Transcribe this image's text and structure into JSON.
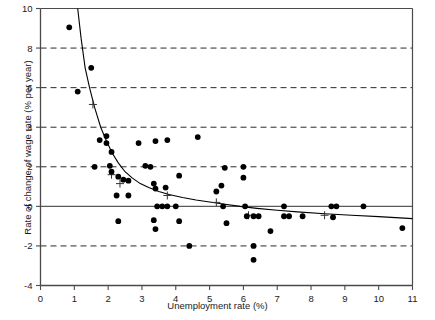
{
  "chart_data": {
    "type": "scatter",
    "title": "",
    "xlabel": "Unemployment rate (%)",
    "ylabel": "Rate of change of wage rate (% per year)",
    "xlim": [
      0,
      11
    ],
    "ylim": [
      -4,
      10
    ],
    "xticks": [
      0,
      1,
      2,
      3,
      4,
      5,
      6,
      7,
      8,
      9,
      10,
      11
    ],
    "yticks": [
      -4,
      -2,
      0,
      2,
      4,
      6,
      8,
      10
    ],
    "grid": "horizontal dashed gridlines at y = -2, 2, 4, 6, 8; solid line at y = 0",
    "legend": "none",
    "series": [
      {
        "name": "Observations",
        "marker": "filled-circle",
        "color": "#000000",
        "points": [
          [
            0.85,
            9.05
          ],
          [
            1.5,
            7.0
          ],
          [
            1.1,
            5.8
          ],
          [
            1.75,
            3.35
          ],
          [
            1.95,
            3.55
          ],
          [
            1.95,
            3.2
          ],
          [
            2.1,
            2.75
          ],
          [
            1.6,
            2.0
          ],
          [
            2.05,
            2.05
          ],
          [
            2.1,
            1.75
          ],
          [
            2.3,
            1.5
          ],
          [
            2.45,
            1.35
          ],
          [
            2.6,
            1.3
          ],
          [
            2.25,
            0.55
          ],
          [
            2.6,
            0.55
          ],
          [
            2.3,
            -0.75
          ],
          [
            2.9,
            3.2
          ],
          [
            3.1,
            2.05
          ],
          [
            3.25,
            2.0
          ],
          [
            3.4,
            3.3
          ],
          [
            3.35,
            1.15
          ],
          [
            3.4,
            0.9
          ],
          [
            3.45,
            0.0
          ],
          [
            3.6,
            0.0
          ],
          [
            3.75,
            0.0
          ],
          [
            3.7,
            0.95
          ],
          [
            3.75,
            3.35
          ],
          [
            3.35,
            -0.7
          ],
          [
            3.4,
            -1.15
          ],
          [
            4.0,
            0.0
          ],
          [
            4.1,
            1.55
          ],
          [
            4.1,
            -0.75
          ],
          [
            4.4,
            -2.0
          ],
          [
            4.65,
            3.5
          ],
          [
            5.2,
            0.75
          ],
          [
            5.35,
            1.05
          ],
          [
            5.4,
            0.0
          ],
          [
            5.5,
            -0.85
          ],
          [
            5.45,
            1.95
          ],
          [
            6.0,
            2.0
          ],
          [
            6.0,
            1.45
          ],
          [
            6.05,
            0.0
          ],
          [
            6.1,
            -0.5
          ],
          [
            6.3,
            -0.5
          ],
          [
            6.45,
            -0.5
          ],
          [
            6.3,
            -2.0
          ],
          [
            6.3,
            -2.7
          ],
          [
            6.8,
            -1.25
          ],
          [
            7.2,
            0.0
          ],
          [
            7.2,
            -0.5
          ],
          [
            7.35,
            -0.5
          ],
          [
            7.75,
            -0.5
          ],
          [
            8.6,
            0.0
          ],
          [
            8.75,
            0.0
          ],
          [
            8.65,
            -0.55
          ],
          [
            9.55,
            0.0
          ],
          [
            10.7,
            -1.1
          ]
        ]
      },
      {
        "name": "Group means",
        "marker": "plus",
        "color": "#333333",
        "points": [
          [
            1.55,
            5.15
          ],
          [
            2.1,
            1.6
          ],
          [
            2.35,
            1.15
          ],
          [
            3.75,
            0.55
          ],
          [
            5.2,
            0.2
          ],
          [
            6.15,
            -0.45
          ],
          [
            8.4,
            -0.45
          ]
        ]
      }
    ],
    "fitted_curve": {
      "name": "Fitted Phillips curve",
      "color": "#000000",
      "points": [
        [
          1.1,
          10.0
        ],
        [
          1.2,
          8.5
        ],
        [
          1.32,
          7.0
        ],
        [
          1.45,
          6.0
        ],
        [
          1.6,
          5.0
        ],
        [
          1.78,
          4.0
        ],
        [
          1.95,
          3.3
        ],
        [
          2.12,
          2.7
        ],
        [
          2.3,
          2.2
        ],
        [
          2.5,
          1.75
        ],
        [
          2.7,
          1.45
        ],
        [
          2.95,
          1.15
        ],
        [
          3.2,
          0.95
        ],
        [
          3.5,
          0.75
        ],
        [
          3.8,
          0.6
        ],
        [
          4.2,
          0.45
        ],
        [
          4.6,
          0.32
        ],
        [
          5.0,
          0.22
        ],
        [
          5.4,
          0.12
        ],
        [
          5.9,
          0.0
        ],
        [
          6.4,
          -0.1
        ],
        [
          7.0,
          -0.2
        ],
        [
          7.6,
          -0.28
        ],
        [
          8.4,
          -0.37
        ],
        [
          9.2,
          -0.45
        ],
        [
          10.0,
          -0.52
        ],
        [
          11.0,
          -0.62
        ]
      ]
    }
  }
}
